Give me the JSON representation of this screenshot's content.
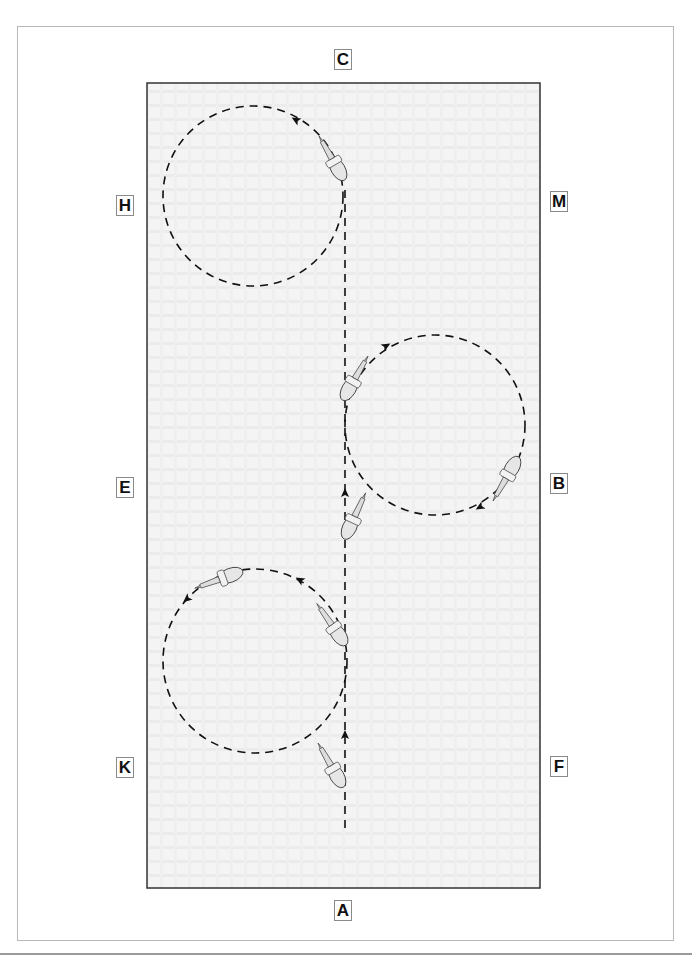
{
  "diagram": {
    "type": "dressage arena movement diagram",
    "arena": {
      "x": 147,
      "y": 83,
      "width": 393,
      "height": 805,
      "border_color": "#333333",
      "fill": "#f2f2f2"
    },
    "centerline_x": 345,
    "markers": [
      {
        "letter": "C",
        "x": 334,
        "y": 49
      },
      {
        "letter": "H",
        "x": 116,
        "y": 195
      },
      {
        "letter": "M",
        "x": 550,
        "y": 191
      },
      {
        "letter": "E",
        "x": 116,
        "y": 477
      },
      {
        "letter": "B",
        "x": 550,
        "y": 473
      },
      {
        "letter": "K",
        "x": 116,
        "y": 757
      },
      {
        "letter": "F",
        "x": 550,
        "y": 756
      },
      {
        "letter": "A",
        "x": 334,
        "y": 900
      }
    ],
    "circles": [
      {
        "name": "circle-left-upper",
        "cx": 253,
        "cy": 196,
        "r": 90,
        "direction": "left"
      },
      {
        "name": "circle-right-middle",
        "cx": 435,
        "cy": 425,
        "r": 90,
        "direction": "right"
      },
      {
        "name": "circle-left-lower",
        "cx": 255,
        "cy": 661,
        "r": 92,
        "direction": "left"
      }
    ],
    "path_color": "#111111"
  }
}
